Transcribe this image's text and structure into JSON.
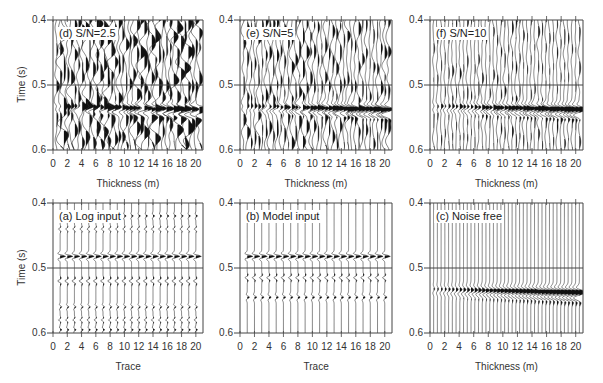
{
  "figure": {
    "y_axis_title": "Time (s)",
    "y_ticks": [
      "0.4",
      "0.5",
      "0.6"
    ],
    "x_ticks": [
      "0",
      "2",
      "4",
      "6",
      "8",
      "10",
      "12",
      "14",
      "16",
      "18",
      "20"
    ]
  },
  "panels": [
    {
      "id": "d",
      "label": "(d) S/N=2.5",
      "xlabel": "Thickness (m)",
      "noise": 0.55,
      "kind": "wedge"
    },
    {
      "id": "e",
      "label": "(e) S/N=5",
      "xlabel": "Thickness (m)",
      "noise": 0.3,
      "kind": "wedge"
    },
    {
      "id": "f",
      "label": "(f) S/N=10",
      "xlabel": "Thickness (m)",
      "noise": 0.15,
      "kind": "wedge"
    },
    {
      "id": "a",
      "label": "(a) Log input",
      "xlabel": "Trace",
      "noise": 0.0,
      "kind": "log"
    },
    {
      "id": "b",
      "label": "(b) Model input",
      "xlabel": "Trace",
      "noise": 0.0,
      "kind": "model"
    },
    {
      "id": "c",
      "label": "(c) Noise free",
      "xlabel": "Thickness (m)",
      "noise": 0.0,
      "kind": "wedge"
    }
  ],
  "chart_data": [
    {
      "type": "seismic-wiggle",
      "title": "(d) S/N=2.5",
      "xlabel": "Thickness (m)",
      "ylabel": "Time (s)",
      "x_range": [
        0,
        21
      ],
      "y_range": [
        0.4,
        0.6
      ],
      "x_ticks": [
        0,
        2,
        4,
        6,
        8,
        10,
        12,
        14,
        16,
        18,
        20
      ],
      "y_ticks": [
        0.4,
        0.5,
        0.6
      ],
      "traces": 40,
      "event": {
        "time_s": 0.535,
        "amplitude_increases_with_thickness": true
      },
      "signal_to_noise": 2.5
    },
    {
      "type": "seismic-wiggle",
      "title": "(e) S/N=5",
      "xlabel": "Thickness (m)",
      "ylabel": "Time (s)",
      "x_range": [
        0,
        21
      ],
      "y_range": [
        0.4,
        0.6
      ],
      "x_ticks": [
        0,
        2,
        4,
        6,
        8,
        10,
        12,
        14,
        16,
        18,
        20
      ],
      "y_ticks": [
        0.4,
        0.5,
        0.6
      ],
      "traces": 40,
      "event": {
        "time_s": 0.535,
        "amplitude_increases_with_thickness": true
      },
      "signal_to_noise": 5
    },
    {
      "type": "seismic-wiggle",
      "title": "(f) S/N=10",
      "xlabel": "Thickness (m)",
      "ylabel": "Time (s)",
      "x_range": [
        0,
        21
      ],
      "y_range": [
        0.4,
        0.6
      ],
      "x_ticks": [
        0,
        2,
        4,
        6,
        8,
        10,
        12,
        14,
        16,
        18,
        20
      ],
      "y_ticks": [
        0.4,
        0.5,
        0.6
      ],
      "traces": 40,
      "event": {
        "time_s": 0.535,
        "amplitude_increases_with_thickness": true
      },
      "signal_to_noise": 10
    },
    {
      "type": "seismic-wiggle",
      "title": "(a) Log input",
      "xlabel": "Trace",
      "ylabel": "Time (s)",
      "x_range": [
        0,
        21
      ],
      "y_range": [
        0.4,
        0.6
      ],
      "x_ticks": [
        0,
        2,
        4,
        6,
        8,
        10,
        12,
        14,
        16,
        18,
        20
      ],
      "y_ticks": [
        0.4,
        0.5,
        0.6
      ],
      "traces": 20,
      "events_time_s": [
        0.42,
        0.44,
        0.482,
        0.52,
        0.56,
        0.58,
        0.595
      ]
    },
    {
      "type": "seismic-wiggle",
      "title": "(b) Model input",
      "xlabel": "Trace",
      "ylabel": "Time (s)",
      "x_range": [
        0,
        21
      ],
      "y_range": [
        0.4,
        0.6
      ],
      "x_ticks": [
        0,
        2,
        4,
        6,
        8,
        10,
        12,
        14,
        16,
        18,
        20
      ],
      "y_ticks": [
        0.4,
        0.5,
        0.6
      ],
      "traces": 20,
      "events_time_s": [
        0.482,
        0.515,
        0.545
      ]
    },
    {
      "type": "seismic-wiggle",
      "title": "(c) Noise free",
      "xlabel": "Thickness (m)",
      "ylabel": "Time (s)",
      "x_range": [
        0,
        21
      ],
      "y_range": [
        0.4,
        0.6
      ],
      "x_ticks": [
        0,
        2,
        4,
        6,
        8,
        10,
        12,
        14,
        16,
        18,
        20
      ],
      "y_ticks": [
        0.4,
        0.5,
        0.6
      ],
      "traces": 40,
      "event": {
        "time_s": 0.535,
        "amplitude_increases_with_thickness": true
      },
      "signal_to_noise": null
    }
  ]
}
